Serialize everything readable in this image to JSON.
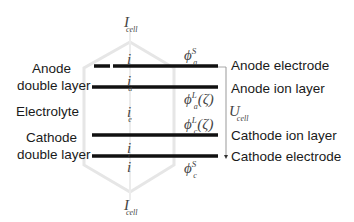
{
  "diagram": {
    "top_current": {
      "symbol": "I",
      "subscript": "cell"
    },
    "bottom_current": {
      "symbol": "I",
      "subscript": "cell"
    },
    "left_labels": {
      "anode_double_layer": [
        "Anode",
        "double layer"
      ],
      "electrolyte": "Electrolyte",
      "cathode_double_layer": [
        "Cathode",
        "double layer"
      ]
    },
    "right_labels": {
      "anode_electrode": "Anode electrode",
      "anode_ion_layer": "Anode ion layer",
      "cathode_ion_layer": "Cathode ion layer",
      "cathode_electrode": "Cathode electrode"
    },
    "voltage": {
      "symbol": "U",
      "subscript": "cell"
    },
    "currents": {
      "i_top": {
        "symbol": "i",
        "subscript": ""
      },
      "i_a": {
        "symbol": "i",
        "subscript": "a"
      },
      "i_e": {
        "symbol": "i",
        "subscript": "e"
      },
      "i_c": {
        "symbol": "i",
        "subscript": "c"
      },
      "i_bottom": {
        "symbol": "i",
        "subscript": ""
      }
    },
    "potentials": {
      "phi_a_s": {
        "symbol": "ϕ",
        "superscript": "S",
        "subscript": "a",
        "arg": ""
      },
      "phi_a_l": {
        "symbol": "ϕ",
        "superscript": "L",
        "subscript": "a",
        "arg": "(ζ)"
      },
      "phi_c_l": {
        "symbol": "ϕ",
        "superscript": "L",
        "subscript": "c",
        "arg": "(ζ)"
      },
      "phi_c_s": {
        "symbol": "ϕ",
        "superscript": "S",
        "subscript": "c",
        "arg": ""
      }
    },
    "colors": {
      "lines": "#111111",
      "outline": "#e6e6e6",
      "bracket": "#999999"
    }
  }
}
